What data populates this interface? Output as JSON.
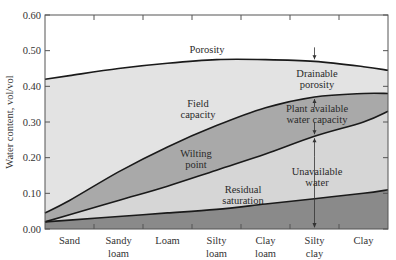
{
  "chart_data": {
    "type": "area",
    "title": "",
    "xlabel": "",
    "ylabel": "Water content, vol/vol",
    "ylim": [
      0.0,
      0.6
    ],
    "yticks": [
      "0.00",
      "0.10",
      "0.20",
      "0.30",
      "0.40",
      "0.50",
      "0.60"
    ],
    "categories": [
      "Sand",
      "Sandy loam",
      "Loam",
      "Silty loam",
      "Clay loam",
      "Silty clay",
      "Clay"
    ],
    "category_labels": [
      [
        "Sand"
      ],
      [
        "Sandy",
        "loam"
      ],
      [
        "Loam"
      ],
      [
        "Silty",
        "loam"
      ],
      [
        "Clay",
        "loam"
      ],
      [
        "Silty",
        "clay"
      ],
      [
        "Clay"
      ]
    ],
    "grid": false,
    "legend": "none (inline annotations)",
    "x_edges": {
      "left": 0.0,
      "right": 7.0
    },
    "series": [
      {
        "name": "Porosity",
        "left_edge": 0.42,
        "values": [
          0.43,
          0.45,
          0.465,
          0.475,
          0.475,
          0.47,
          0.455
        ],
        "right_edge": 0.445
      },
      {
        "name": "Field capacity",
        "left_edge": 0.045,
        "values": [
          0.08,
          0.16,
          0.23,
          0.29,
          0.34,
          0.37,
          0.38
        ],
        "right_edge": 0.38
      },
      {
        "name": "Wilting point",
        "left_edge": 0.02,
        "values": [
          0.04,
          0.08,
          0.12,
          0.165,
          0.21,
          0.26,
          0.3
        ],
        "right_edge": 0.33
      },
      {
        "name": "Residual saturation",
        "left_edge": 0.02,
        "values": [
          0.025,
          0.035,
          0.045,
          0.055,
          0.07,
          0.085,
          0.1
        ],
        "right_edge": 0.11
      }
    ],
    "bands": [
      {
        "name": "Drainable porosity",
        "between": [
          "Field capacity",
          "Porosity"
        ],
        "color": "#e3e3e3"
      },
      {
        "name": "Plant available water capacity",
        "between": [
          "Wilting point",
          "Field capacity"
        ],
        "color": "#a9a9a9"
      },
      {
        "name": "Unavailable water",
        "between": [
          "Residual saturation",
          "Wilting point"
        ],
        "color": "#d6d6d6"
      },
      {
        "name": "Residual",
        "between": [
          "0",
          "Residual saturation"
        ],
        "color": "#8a8a8a"
      }
    ],
    "annotations": [
      {
        "text": [
          "Porosity"
        ]
      },
      {
        "text": [
          "Field",
          "capacity"
        ]
      },
      {
        "text": [
          "Wilting",
          "point"
        ]
      },
      {
        "text": [
          "Residual",
          "saturation"
        ]
      },
      {
        "text": [
          "Drainable",
          "porosity"
        ]
      },
      {
        "text": [
          "Plant available",
          "water capacity"
        ]
      },
      {
        "text": [
          "Unavailable",
          "water"
        ]
      }
    ],
    "arrow_at_category": "Silty clay"
  },
  "labels": {
    "ylabel": "Water content, vol/vol",
    "porosity": "Porosity",
    "field_1": "Field",
    "field_2": "capacity",
    "wilting_1": "Wilting",
    "wilting_2": "point",
    "residual_1": "Residual",
    "residual_2": "saturation",
    "drainable_1": "Drainable",
    "drainable_2": "porosity",
    "plant_1": "Plant available",
    "plant_2": "water capacity",
    "unavail_1": "Unavailable",
    "unavail_2": "water"
  },
  "colors": {
    "drainable": "#e3e3e3",
    "plant_available": "#a9a9a9",
    "unavailable": "#d6d6d6",
    "residual": "#8a8a8a",
    "line": "#1a1a1a",
    "axis": "#555555"
  }
}
